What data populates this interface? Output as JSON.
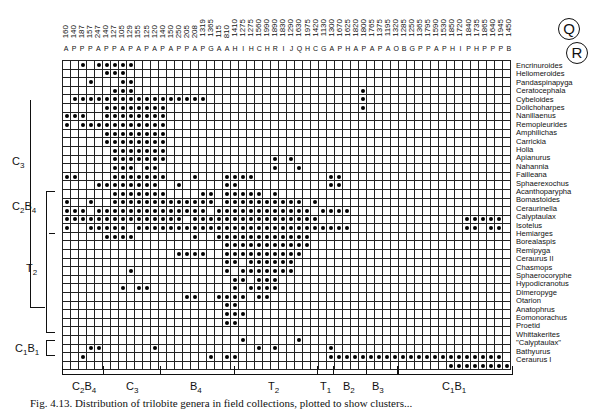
{
  "chart_data": {
    "type": "heatmap",
    "title": "Distribution of trilobite genera in field collections, plotted to show clusters",
    "subtitle": "Presence/absence matrix (dots = genus present in collection)",
    "circle_labels": [
      "Q",
      "R"
    ],
    "collections": [
      "A160",
      "P140",
      "P187",
      "P157",
      "A247",
      "P140",
      "P127",
      "A105",
      "P129",
      "A155",
      "P125",
      "A120",
      "P140",
      "A150",
      "P250",
      "P205",
      "A208",
      "P1319",
      "G1365",
      "A115",
      "A810",
      "H1410",
      "I1275",
      "H1275",
      "C1560",
      "H1990",
      "R1890",
      "I1830",
      "J1290",
      "Q1630",
      "H1975",
      "C1420",
      "G1130",
      "A1300",
      "P1670",
      "H1625",
      "A1820",
      "P1800",
      "A1765",
      "P1375",
      "A1195",
      "O1320",
      "B1285",
      "G1250",
      "P1365",
      "P1795",
      "A1590",
      "P1530",
      "H1850",
      "I1720",
      "P1840",
      "H1735",
      "P1865",
      "P1640",
      "P1945",
      "B1450"
    ],
    "genera": [
      "Encrinuroides",
      "Heliomeroides",
      "Pandaspinapyga",
      "Ceratocephala",
      "Cybeloides",
      "Dolichoharpes",
      "Nanillaenus",
      "Remopleurides",
      "Amphilichas",
      "Carrickia",
      "Holia",
      "Apianurus",
      "Nahannia",
      "Failleana",
      "Sphaerexochus",
      "Acanthoparypha",
      "Bomastoides",
      "Ceraurinella",
      "Calyptaulax",
      "Isotelus",
      "Hemiarges",
      "Borealaspis",
      "Remipyga",
      "Ceraurus II",
      "Chasmops",
      "Sphaerocoryphe",
      "Hypodicranotus",
      "Dimeropyge",
      "Otarion",
      "Anatophrus",
      "Eomonorachus",
      "Proetid",
      "Whittakerites",
      "\"Calyptaulax\"",
      "Bathyurus",
      "Ceraurus I"
    ],
    "row_clusters": [
      {
        "label": "C3",
        "from": "Cybeloides",
        "to": "Failleana"
      },
      {
        "label": "C2B4",
        "from": "Acanthoparypha",
        "to": "Isotelus"
      },
      {
        "label": "T2",
        "from": "Hemiarges",
        "to": "Whittakerites"
      },
      {
        "label": "C1B1",
        "from": "\"Calyptaulax\"",
        "to": "Ceraurus I"
      }
    ],
    "column_clusters": [
      "C2B4",
      "C3",
      "B4",
      "T2",
      "T1",
      "B2",
      "B3",
      "C1B1"
    ],
    "grid_cols": 56,
    "grid_rows": 36,
    "presence": [
      [
        2,
        4,
        5,
        6,
        7,
        8
      ],
      [
        5,
        6,
        7
      ],
      [
        3,
        7,
        8
      ],
      [
        6,
        7,
        8,
        37
      ],
      [
        1,
        2,
        3,
        4,
        5,
        6,
        7,
        8,
        9,
        10,
        11,
        12,
        13,
        14,
        15,
        16,
        17,
        37
      ],
      [
        5,
        6,
        7,
        8,
        9,
        10,
        11,
        12,
        37
      ],
      [
        0,
        1,
        2,
        5,
        6,
        7,
        8,
        9,
        10,
        11,
        12
      ],
      [
        0,
        2,
        3,
        4,
        5,
        6,
        7,
        8,
        9,
        10,
        11,
        12
      ],
      [
        5,
        6,
        7,
        8,
        9,
        10,
        11,
        12
      ],
      [
        5,
        6,
        7,
        8,
        9,
        10,
        11,
        12
      ],
      [
        6,
        7,
        8,
        9,
        10,
        11,
        12
      ],
      [
        6,
        7,
        8,
        9,
        10,
        11,
        12,
        26,
        28
      ],
      [
        6,
        7,
        8,
        10,
        11,
        26,
        29
      ],
      [
        0,
        1,
        6,
        7,
        8,
        9,
        10,
        11,
        12,
        16,
        20,
        21,
        22,
        23,
        33,
        34
      ],
      [
        4,
        5,
        6,
        7,
        8,
        9,
        10,
        11,
        14,
        20,
        21,
        33,
        34
      ],
      [
        6,
        7,
        8,
        9,
        10,
        11,
        12,
        17,
        18,
        20,
        21,
        22,
        23,
        24,
        26
      ],
      [
        0,
        3,
        6,
        7,
        8,
        9,
        10,
        11,
        12,
        13,
        14,
        15,
        16,
        17,
        18,
        20,
        21,
        22,
        23,
        24,
        25,
        26,
        27,
        28,
        29,
        31
      ],
      [
        0,
        1,
        2,
        4,
        5,
        6,
        7,
        8,
        9,
        10,
        11,
        12,
        13,
        14,
        15,
        16,
        17,
        19,
        20,
        21,
        22,
        23,
        24,
        25,
        26,
        27,
        28,
        29,
        30,
        32,
        33,
        34,
        35
      ],
      [
        0,
        1,
        2,
        3,
        4,
        5,
        6,
        7,
        8,
        9,
        10,
        11,
        12,
        13,
        14,
        16,
        17,
        18,
        19,
        20,
        21,
        22,
        23,
        24,
        25,
        26,
        27,
        28,
        29,
        30,
        31,
        50,
        51,
        52,
        53,
        54
      ],
      [
        0,
        3,
        4,
        5,
        6,
        7,
        9,
        10,
        11,
        12,
        13,
        14,
        15,
        16,
        17,
        18,
        19,
        20,
        21,
        22,
        23,
        24,
        25,
        26,
        27,
        28,
        29,
        30,
        31,
        32,
        33,
        34,
        35,
        50,
        51,
        53,
        54
      ],
      [
        5,
        6,
        7,
        8,
        16,
        19,
        20,
        21,
        22,
        23,
        24,
        25,
        26,
        27,
        28,
        29,
        30
      ],
      [
        20,
        21,
        22,
        23,
        24,
        25,
        26,
        27,
        28,
        29,
        30
      ],
      [
        14,
        15,
        16,
        17,
        20,
        21,
        22,
        23,
        24,
        25,
        26,
        27,
        28,
        29
      ],
      [
        20,
        21,
        23,
        24,
        25,
        26,
        27,
        28
      ],
      [
        8,
        20,
        22,
        23,
        24,
        25,
        26,
        27,
        28
      ],
      [
        21,
        22,
        24,
        25,
        26
      ],
      [
        7,
        9,
        10,
        21,
        23,
        24,
        25,
        26
      ],
      [
        15,
        16,
        19,
        20,
        21,
        22,
        24,
        25
      ],
      [
        20,
        21
      ],
      [
        20,
        21,
        22
      ],
      [
        20,
        21
      ],
      [],
      [
        22,
        29
      ],
      [
        3,
        4,
        11,
        24,
        26,
        33
      ],
      [
        2,
        18,
        20,
        21,
        33,
        34,
        35,
        36,
        37,
        38,
        39,
        40,
        41,
        42,
        43,
        44,
        45,
        46,
        47,
        48,
        49,
        50,
        51,
        52,
        53,
        54
      ],
      [
        48,
        49,
        50,
        51,
        52,
        53,
        54,
        55
      ]
    ]
  },
  "caption": "Fig. 4.13. Distribution of trilobite genera in field collections, plotted to show clusters...",
  "labels": {
    "left": [
      "C3",
      "C2B4",
      "T2",
      "C1B1"
    ],
    "bottom": [
      "C2B4",
      "C3",
      "B4",
      "T2",
      "T1",
      "B2",
      "B3",
      "C1B1"
    ]
  }
}
